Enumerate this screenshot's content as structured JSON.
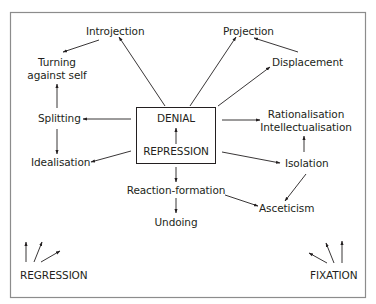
{
  "diagram": {
    "colors": {
      "stroke": "#231f20",
      "frame": "#8c8c8c",
      "background": "#ffffff"
    },
    "center_box": {
      "top_label": "DENIAL",
      "bottom_label": "REPRESSION"
    },
    "nodes": {
      "introjection": "Introjection",
      "turning_line1": "Turning",
      "turning_line2": "against self",
      "splitting": "Splitting",
      "idealisation": "Idealisation",
      "projection": "Projection",
      "displacement": "Displacement",
      "rationalisation": "Rationalisation",
      "intellectualisation": "Intellectualisation",
      "isolation": "Isolation",
      "reaction_formation": "Reaction-formation",
      "undoing": "Undoing",
      "asceticism": "Asceticism",
      "regression": "REGRESSION",
      "fixation": "FIXATION"
    },
    "edges": [
      {
        "from": "REPRESSION",
        "to": "DENIAL"
      },
      {
        "from": "center_box",
        "to": "Introjection"
      },
      {
        "from": "Introjection",
        "to": "Turning against self"
      },
      {
        "from": "Splitting",
        "to": "Turning against self"
      },
      {
        "from": "center_box",
        "to": "Splitting"
      },
      {
        "from": "Splitting",
        "to": "Idealisation"
      },
      {
        "from": "center_box",
        "to": "Idealisation"
      },
      {
        "from": "center_box",
        "to": "Projection"
      },
      {
        "from": "Displacement",
        "to": "Projection"
      },
      {
        "from": "center_box",
        "to": "Displacement"
      },
      {
        "from": "center_box",
        "to": "Rationalisation Intellectualisation"
      },
      {
        "from": "Isolation",
        "to": "Rationalisation Intellectualisation"
      },
      {
        "from": "center_box",
        "to": "Isolation"
      },
      {
        "from": "Isolation",
        "to": "Asceticism"
      },
      {
        "from": "center_box",
        "to": "Reaction-formation"
      },
      {
        "from": "Reaction-formation",
        "to": "Undoing"
      },
      {
        "from": "Reaction-formation",
        "to": "Asceticism"
      },
      {
        "from": "REGRESSION",
        "to": "upward (3 arrows)"
      },
      {
        "from": "FIXATION",
        "to": "upward (3 arrows)"
      }
    ]
  }
}
